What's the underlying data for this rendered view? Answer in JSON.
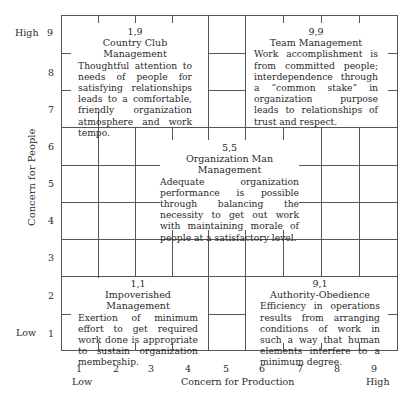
{
  "diagram": {
    "y_axis": {
      "title": "Concern for People",
      "ticks": [
        "9",
        "8",
        "7",
        "6",
        "5",
        "4",
        "3",
        "2",
        "1"
      ],
      "high_label": "High",
      "low_label": "Low"
    },
    "x_axis": {
      "title": "Concern for Production",
      "ticks": [
        "1",
        "2",
        "3",
        "4",
        "5",
        "6",
        "7",
        "8",
        "9"
      ],
      "low_label": "Low",
      "high_label": "High"
    },
    "boxes": [
      {
        "id": "1,9",
        "coord": "1,9",
        "title": "Country Club Management",
        "description": "Thoughtful attention to needs of people for satisfying relationships leads to a comfortable, friendly organization atmosphere and work tempo."
      },
      {
        "id": "9,9",
        "coord": "9,9",
        "title": "Team Management",
        "description": "Work accomplishment is from committed people; interdependence through a “common stake” in organization purpose leads to relationships of trust and respect."
      },
      {
        "id": "5,5",
        "coord": "5,5",
        "title": "Organization Man Management",
        "description": "Adequate organization performance is possible through balancing the necessity to get out work with maintaining morale of people at a satisfactory level."
      },
      {
        "id": "1,1",
        "coord": "1,1",
        "title": "Impoverished Management",
        "description": "Exertion of minimum effort to get required work done is appropriate to sustain organization membership."
      },
      {
        "id": "9,1",
        "coord": "9,1",
        "title": "Authority-Obedience",
        "description": "Efficiency in operations results from arranging conditions of work in such a way that human elements interfere to a minimum degree."
      }
    ]
  }
}
